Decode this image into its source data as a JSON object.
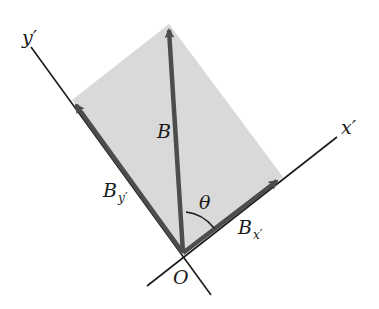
{
  "diagram": {
    "colors": {
      "background": "#ffffff",
      "parallelogram_fill": "#d9d9d9",
      "vector": "#4d4d4d",
      "axis": "#1a1a1a",
      "text": "#1a1a1a"
    },
    "labels": {
      "y_axis": "y′",
      "x_axis": "x′",
      "vector_B": "B",
      "component_By": "B",
      "component_By_sub": "y′",
      "component_Bx": "B",
      "component_Bx_sub": "x′",
      "angle": "θ",
      "origin": "O"
    },
    "points": {
      "origin": [
        183,
        253
      ],
      "B_tip": [
        169,
        24
      ],
      "By_tip": [
        72,
        100
      ],
      "Bx_tip": [
        283,
        177
      ]
    }
  }
}
